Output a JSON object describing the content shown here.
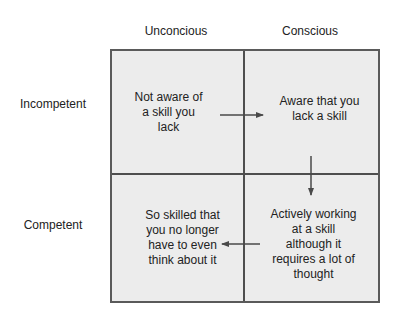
{
  "diagram": {
    "type": "2x2 matrix",
    "columns": [
      {
        "label": "Unconcious"
      },
      {
        "label": "Conscious"
      }
    ],
    "rows": [
      {
        "label": "Incompetent"
      },
      {
        "label": "Competent"
      }
    ],
    "cells": {
      "incompetent_unconscious": {
        "lines": [
          "Not aware of",
          "a skill you",
          "lack"
        ]
      },
      "incompetent_conscious": {
        "lines": [
          "Aware that you",
          "lack a skill"
        ]
      },
      "competent_unconscious": {
        "lines": [
          "So skilled that",
          "you no longer",
          "have to even",
          "think about it"
        ]
      },
      "competent_conscious": {
        "lines": [
          "Actively working",
          "at a skill",
          "although it",
          "requires a lot of",
          "thought"
        ]
      }
    },
    "arrows": [
      {
        "from": "incompetent_unconscious",
        "to": "incompetent_conscious",
        "direction": "right"
      },
      {
        "from": "incompetent_conscious",
        "to": "competent_conscious",
        "direction": "down"
      },
      {
        "from": "competent_conscious",
        "to": "competent_unconscious",
        "direction": "left"
      }
    ],
    "colors": {
      "cell_fill": "#ececec",
      "border": "#5a5a5a",
      "text": "#222222",
      "arrow": "#4a4a4a"
    }
  }
}
